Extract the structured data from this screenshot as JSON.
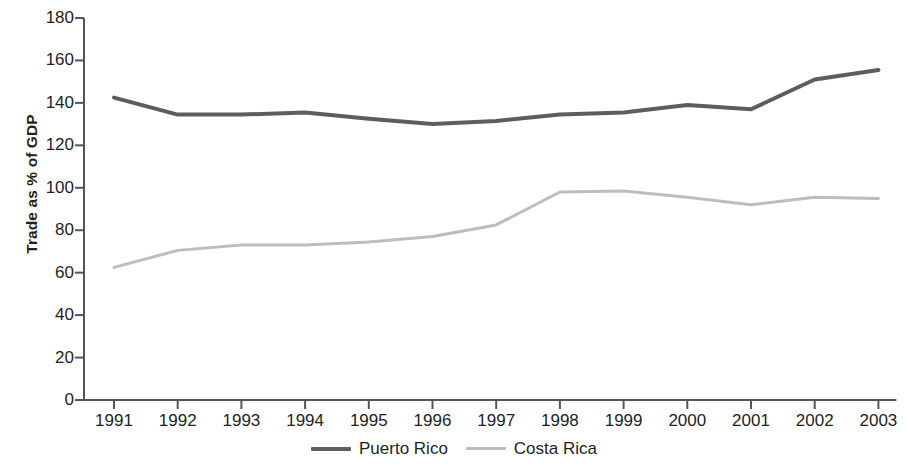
{
  "chart_data": {
    "type": "line",
    "title": "",
    "xlabel": "",
    "ylabel": "Trade as % of GDP",
    "categories": [
      "1991",
      "1992",
      "1993",
      "1994",
      "1995",
      "1996",
      "1997",
      "1998",
      "1999",
      "2000",
      "2001",
      "2002",
      "2003"
    ],
    "x": [
      1991,
      1992,
      1993,
      1994,
      1995,
      1996,
      1997,
      1998,
      1999,
      2000,
      2001,
      2002,
      2003
    ],
    "series": [
      {
        "name": "Puerto Rico",
        "color": "#5d5d5d",
        "values": [
          142.5,
          134.5,
          134.5,
          135.5,
          132.5,
          130,
          131.5,
          134.5,
          135.5,
          139,
          137,
          151,
          155.5
        ]
      },
      {
        "name": "Costa Rica",
        "color": "#bdbdbd",
        "values": [
          62.5,
          70.5,
          73,
          73,
          74.5,
          77,
          82.5,
          98,
          98.5,
          95.5,
          92,
          95.5,
          95
        ]
      }
    ],
    "ylim": [
      0,
      180
    ],
    "ytick_values": [
      0,
      20,
      40,
      60,
      80,
      100,
      120,
      140,
      160,
      180
    ],
    "ytick_labels": [
      "0",
      "20",
      "40",
      "60",
      "80",
      "100",
      "120",
      "140",
      "160",
      "180"
    ],
    "grid": false,
    "legend_position": "bottom-center",
    "legend": [
      {
        "label": "Puerto Rico",
        "color": "#5d5d5d",
        "style": "thick"
      },
      {
        "label": "Costa Rica",
        "color": "#bdbdbd",
        "style": "thin"
      }
    ],
    "axis_color": "#555555"
  }
}
